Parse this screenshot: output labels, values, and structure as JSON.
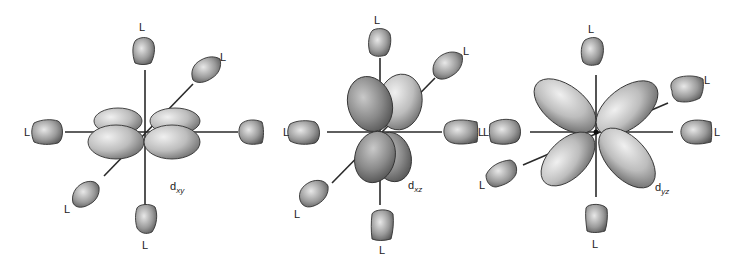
{
  "figure": {
    "ligand_label": "L",
    "panels": [
      {
        "id": "dxy",
        "label_main": "d",
        "label_sub": "xy",
        "ligand_count": 6,
        "ligand_labels": [
          "L",
          "L",
          "L",
          "L",
          "L",
          "L"
        ]
      },
      {
        "id": "dxz",
        "label_main": "d",
        "label_sub": "xz",
        "ligand_count": 6,
        "ligand_labels": [
          "L",
          "L",
          "L",
          "L",
          "L",
          "L"
        ]
      },
      {
        "id": "dyz",
        "label_main": "d",
        "label_sub": "yz",
        "ligand_count": 6,
        "ligand_labels": [
          "L",
          "L",
          "L",
          "L",
          "L",
          "L"
        ]
      }
    ]
  },
  "colors": {
    "background": "#ffffff",
    "lobe_light": "#e6e6e6",
    "lobe_dark": "#6e6e6e",
    "axis": "#2a2a2a",
    "text": "#222222"
  }
}
